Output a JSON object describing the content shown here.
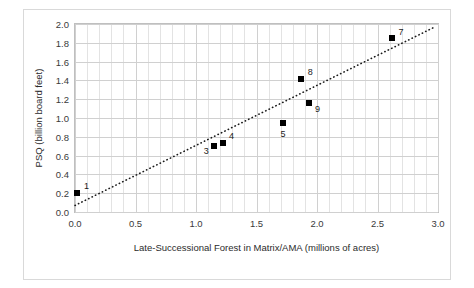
{
  "chart_data": {
    "type": "scatter",
    "title": "",
    "xlabel": "Late-Successional Forest in Matrix/AMA (millions of acres)",
    "ylabel": "PSQ (billion board feet)",
    "xlim": [
      0.0,
      3.0
    ],
    "ylim": [
      0.0,
      2.0
    ],
    "xticks": [
      "0.0",
      "0.5",
      "1.0",
      "1.5",
      "2.0",
      "2.5",
      "3.0"
    ],
    "xtick_values": [
      0.0,
      0.5,
      1.0,
      1.5,
      2.0,
      2.5,
      3.0
    ],
    "yticks": [
      "0.0",
      "0.2",
      "0.4",
      "0.6",
      "0.8",
      "1.0",
      "1.2",
      "1.4",
      "1.6",
      "1.8",
      "2.0"
    ],
    "ytick_values": [
      0.0,
      0.2,
      0.4,
      0.6,
      0.8,
      1.0,
      1.2,
      1.4,
      1.6,
      1.8,
      2.0
    ],
    "x_minor_step": 0.1,
    "grid": true,
    "legend": "none",
    "points": [
      {
        "label": "1",
        "x": 0.02,
        "y": 0.2,
        "label_dx": 9,
        "label_dy": -7
      },
      {
        "label": "3",
        "x": 1.15,
        "y": 0.7,
        "label_dx": -8,
        "label_dy": 5
      },
      {
        "label": "4",
        "x": 1.22,
        "y": 0.73,
        "label_dx": 9,
        "label_dy": -7
      },
      {
        "label": "5",
        "x": 1.72,
        "y": 0.95,
        "label_dx": 0,
        "label_dy": 11
      },
      {
        "label": "8",
        "x": 1.87,
        "y": 1.41,
        "label_dx": 9,
        "label_dy": -7
      },
      {
        "label": "9",
        "x": 1.93,
        "y": 1.16,
        "label_dx": 9,
        "label_dy": 6
      },
      {
        "label": "7",
        "x": 2.62,
        "y": 1.85,
        "label_dx": 9,
        "label_dy": -6
      }
    ],
    "trendline": {
      "style": "dotted",
      "color": "#1a1a1a",
      "x0": 0.0,
      "y0": 0.07,
      "x1": 2.96,
      "y1": 1.96
    }
  }
}
